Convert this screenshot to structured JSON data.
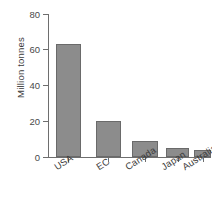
{
  "chart_data": {
    "type": "bar",
    "title": "",
    "subtitle": "",
    "xlabel": "",
    "ylabel": "Million tonnes",
    "categories": [
      "USA",
      "EC",
      "Canada",
      "Japan",
      "Australia"
    ],
    "values": [
      63,
      20,
      9,
      5,
      4
    ],
    "series": [
      {
        "name": "Million tonnes",
        "values": [
          63,
          20,
          9,
          5,
          4
        ]
      }
    ],
    "ylim": [
      0,
      80
    ],
    "yticks": [
      0,
      20,
      40,
      60,
      80
    ],
    "ytick_labels": [
      "0",
      "20",
      "40",
      "60",
      "80"
    ],
    "xtick_labels": [
      "USA",
      "EC",
      "Canada",
      "Japan",
      "Australia"
    ],
    "grid": false,
    "legend": false,
    "legend_position": "none",
    "annotations": [],
    "colors": {
      "bar_fill": "#8c8c8c",
      "bar_border": "#6a6a6a",
      "axis": "#6e6e6e",
      "text": "#3b3b3b",
      "background": "#ffffff"
    }
  },
  "axis": {
    "y_title": "Million tonnes",
    "y_labels": [
      "80",
      "60",
      "40",
      "20",
      "0"
    ]
  },
  "bars": [
    {
      "label": "USA",
      "value": 63
    },
    {
      "label": "EC",
      "value": 20
    },
    {
      "label": "Canada",
      "value": 9
    },
    {
      "label": "Japan",
      "value": 5
    },
    {
      "label": "Australia",
      "value": 4
    }
  ]
}
